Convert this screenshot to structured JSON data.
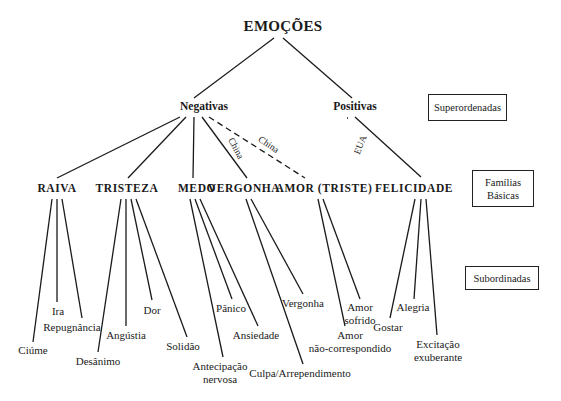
{
  "diagram": {
    "root": "EMOÇÕES",
    "superordinate": {
      "negative": "Negativas",
      "positive": "Positivas"
    },
    "basic_families": {
      "raiva": "RAIVA",
      "tristeza": "TRISTEZA",
      "medo": "MEDO",
      "vergonha": "VERGONHA",
      "amor": "AMOR (TRISTE)",
      "felicidade": "FELICIDADE"
    },
    "edge_labels": {
      "china_vergonha": "China",
      "china_amor": "China",
      "eua_amor": "EUA"
    },
    "subordinate": {
      "raiva": [
        "Ciúme",
        "Ira",
        "Repugnância"
      ],
      "tristeza": [
        "Desânimo",
        "Angústia",
        "Dor",
        "Solidão"
      ],
      "medo": {
        "antecipacao_1": "Antecipação",
        "antecipacao_2": "nervosa",
        "panico": "Pânico",
        "ansiedade": "Ansiedade"
      },
      "vergonha": [
        "Culpa/Arrependimento",
        "Vergonha"
      ],
      "amor": {
        "nao_corresp_1": "Amor",
        "nao_corresp_2": "não-correspondido",
        "sofrido_1": "Amor",
        "sofrido_2": "sofrido"
      },
      "felicidade": {
        "gostar": "Gostar",
        "alegria": "Alegria",
        "excitacao_1": "Excitação",
        "excitacao_2": "exuberante"
      }
    },
    "level_labels": {
      "superordinate": "Superordenadas",
      "basic_1": "Famílias",
      "basic_2": "Básicas",
      "subordinate": "Subordinadas"
    }
  }
}
